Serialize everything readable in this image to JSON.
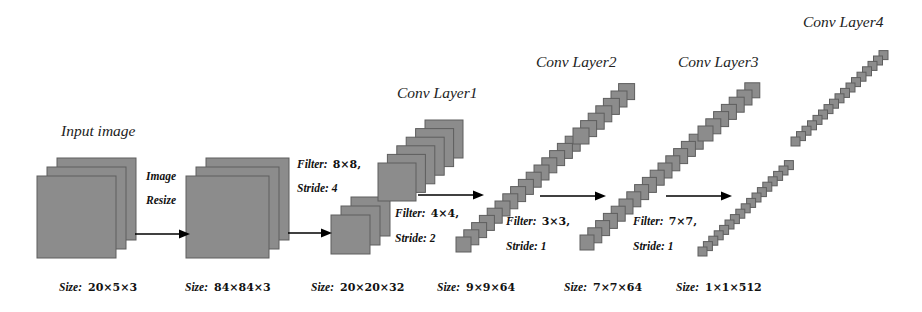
{
  "diagram": {
    "colors": {
      "block_fill": "#8c8c8c",
      "block_stroke": "#5e5e5e",
      "arrow": "#000000",
      "background": "#ffffff"
    },
    "stages": [
      {
        "id": "input",
        "title": "Input image",
        "size_label": "Size:",
        "size_value": "20×5×3",
        "stacks": [
          {
            "x": 37,
            "y": 176,
            "w": 79,
            "h": 82,
            "n": 3,
            "dx": 10,
            "dy": -9
          }
        ]
      },
      {
        "id": "resized",
        "title": "",
        "size_label": "Size:",
        "size_value": "84×84×3",
        "stacks": [
          {
            "x": 186,
            "y": 176,
            "w": 83,
            "h": 82,
            "n": 3,
            "dx": 10,
            "dy": -9
          }
        ]
      },
      {
        "id": "conv1",
        "title": "Conv Layer1",
        "size_label": "Size:",
        "size_value": "20×20×32",
        "stacks": [
          {
            "x": 331,
            "y": 215,
            "w": 39,
            "h": 39,
            "n": 3,
            "dx": 10,
            "dy": -9
          },
          {
            "x": 378,
            "y": 163,
            "w": 38,
            "h": 38,
            "n": 6,
            "dx": 9.4,
            "dy": -8.6
          }
        ]
      },
      {
        "id": "conv2",
        "title": "Conv Layer2",
        "size_label": "Size:",
        "size_value": "9×9×64",
        "stacks": [
          {
            "x": 456,
            "y": 237,
            "w": 15,
            "h": 15,
            "n": 15,
            "dx": 7.8,
            "dy": -7.2
          },
          {
            "x": 573,
            "y": 128,
            "w": 16,
            "h": 16,
            "n": 7,
            "dx": 7.6,
            "dy": -7.4
          }
        ]
      },
      {
        "id": "conv3",
        "title": "Conv Layer3",
        "size_label": "Size:",
        "size_value": "7×7×64",
        "stacks": [
          {
            "x": 580,
            "y": 235,
            "w": 14,
            "h": 15,
            "n": 15,
            "dx": 7.8,
            "dy": -7.2
          },
          {
            "x": 698,
            "y": 126,
            "w": 15,
            "h": 15,
            "n": 7,
            "dx": 7.8,
            "dy": -7.2
          }
        ]
      },
      {
        "id": "conv4",
        "title": "Conv Layer4",
        "size_label": "Size:",
        "size_value": "1×1×512",
        "stacks": [
          {
            "x": 698,
            "y": 247,
            "w": 9,
            "h": 9,
            "n": 17,
            "dx": 5.4,
            "dy": -5.4
          },
          {
            "x": 791,
            "y": 137,
            "w": 9,
            "h": 9,
            "n": 17,
            "dx": 5.5,
            "dy": -5.4
          }
        ]
      }
    ],
    "arrows": [
      {
        "id": "resize-arrow",
        "x1": 135,
        "x2": 190,
        "y": 234
      },
      {
        "id": "conv1-arrow",
        "x1": 288,
        "x2": 332,
        "y": 233
      },
      {
        "id": "conv2-arrow",
        "x1": 418,
        "x2": 484,
        "y": 195
      },
      {
        "id": "conv3-arrow",
        "x1": 540,
        "x2": 606,
        "y": 196
      },
      {
        "id": "conv4-arrow",
        "x1": 666,
        "x2": 732,
        "y": 196
      }
    ],
    "transitions": [
      {
        "id": "resize",
        "line1": "Image",
        "line2": "Resize",
        "x": 146,
        "y": 170
      },
      {
        "id": "t1",
        "filter_label": "Filter:",
        "filter_value": "8×8,",
        "stride_label": "Stride:",
        "stride_value": "4",
        "x": 297,
        "y": 158
      },
      {
        "id": "t2",
        "filter_label": "Filter:",
        "filter_value": "4×4,",
        "stride_label": "Stride:",
        "stride_value": "2",
        "x": 395,
        "y": 207
      },
      {
        "id": "t3",
        "filter_label": "Filter:",
        "filter_value": "3×3,",
        "stride_label": "Stride:",
        "stride_value": "1",
        "x": 506,
        "y": 215
      },
      {
        "id": "t4",
        "filter_label": "Filter:",
        "filter_value": "7×7,",
        "stride_label": "Stride:",
        "stride_value": "1",
        "x": 633,
        "y": 215
      }
    ],
    "title_positions": [
      {
        "stage": 0,
        "x": 61,
        "y": 131
      },
      {
        "stage": 2,
        "x": 397,
        "y": 93
      },
      {
        "stage": 3,
        "x": 536,
        "y": 62
      },
      {
        "stage": 4,
        "x": 678,
        "y": 62
      },
      {
        "stage": 5,
        "x": 803,
        "y": 22
      }
    ],
    "size_positions": [
      {
        "stage": 0,
        "x": 59,
        "y": 281
      },
      {
        "stage": 1,
        "x": 185,
        "y": 281
      },
      {
        "stage": 2,
        "x": 311,
        "y": 281
      },
      {
        "stage": 3,
        "x": 437,
        "y": 281
      },
      {
        "stage": 4,
        "x": 564,
        "y": 281
      },
      {
        "stage": 5,
        "x": 676,
        "y": 281
      }
    ]
  }
}
